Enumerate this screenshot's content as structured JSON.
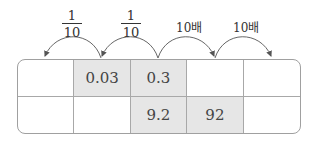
{
  "arrows": [
    {
      "label_type": "fraction",
      "numerator": "1",
      "denominator": "10",
      "direction": "left",
      "from_col": 2,
      "to_col": 1
    },
    {
      "label_type": "fraction",
      "numerator": "1",
      "denominator": "10",
      "direction": "left",
      "from_col": 3,
      "to_col": 2
    },
    {
      "label_type": "text",
      "label": "10배",
      "direction": "right",
      "from_col": 3,
      "to_col": 4
    },
    {
      "label_type": "text",
      "label": "10배",
      "direction": "right",
      "from_col": 4,
      "to_col": 5
    }
  ],
  "table": {
    "rows": [
      [
        "",
        "0.03",
        "0.3",
        "",
        ""
      ],
      [
        "",
        "",
        "9.2",
        "92",
        ""
      ]
    ],
    "shaded": [
      [
        false,
        true,
        true,
        false,
        false
      ],
      [
        false,
        false,
        true,
        true,
        false
      ]
    ]
  },
  "colors": {
    "shade": "#e6e6e6",
    "border": "#a0a0a0",
    "arrow": "#555555"
  }
}
